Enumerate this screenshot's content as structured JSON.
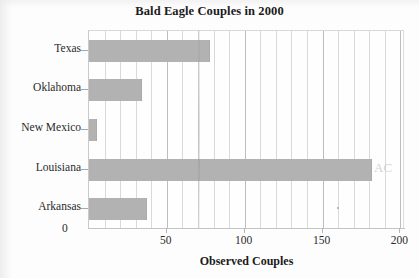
{
  "chart_data": {
    "type": "bar",
    "orientation": "horizontal",
    "title": "Bald Eagle Couples in 2000",
    "xlabel": "Observed Couples",
    "ylabel": "",
    "categories": [
      "Arkansas",
      "Louisiana",
      "New Mexico",
      "Oklahoma",
      "Texas"
    ],
    "values": [
      37,
      182,
      5,
      34,
      78
    ],
    "xlim": [
      0,
      203
    ],
    "xticks": [
      50,
      100,
      150,
      200
    ],
    "xtick_labels": [
      "50",
      "100",
      "150",
      "200"
    ],
    "origin_label": "0",
    "grid": true,
    "grid_minor_step": 10,
    "legend": null,
    "bar_color": "#b2b2b2",
    "background_color": "#fefefe",
    "axis_color": "#c4c4c4",
    "text_color": "#2a2a2a"
  },
  "artifacts": {
    "pencil_mark": "AC"
  }
}
